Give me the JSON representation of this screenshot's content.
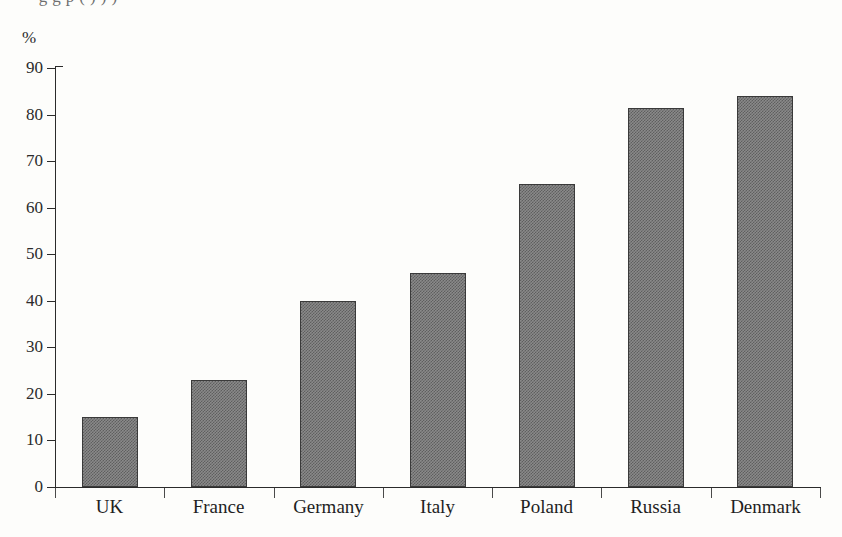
{
  "figure": {
    "cropped_top_text": "·  g       g            p                 ( )   ) )",
    "background_color": "#fdfdfb",
    "bar_fill_color": "#808080",
    "bar_border_color": "#3a3a3a",
    "axis_color": "#2b2b2b"
  },
  "chart_data": {
    "type": "bar",
    "title": "",
    "subtitle": "",
    "xlabel": "",
    "ylabel": "%",
    "categories": [
      "UK",
      "France",
      "Germany",
      "Italy",
      "Poland",
      "Russia",
      "Denmark"
    ],
    "values": [
      15,
      23,
      40,
      46,
      65,
      81.5,
      84
    ],
    "series": [
      {
        "name": "",
        "values": [
          15,
          23,
          40,
          46,
          65,
          81.5,
          84
        ]
      }
    ],
    "ylim": [
      0,
      90
    ],
    "yticks": [
      0,
      10,
      20,
      30,
      40,
      50,
      60,
      70,
      80,
      90
    ],
    "ytick_labels": [
      "0",
      "10",
      "20",
      "30",
      "40",
      "50",
      "60",
      "70",
      "80",
      "90"
    ],
    "grid": false,
    "legend": false,
    "legend_position": "none",
    "annotations": []
  }
}
